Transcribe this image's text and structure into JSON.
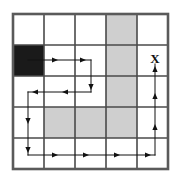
{
  "figure": {
    "title": "",
    "type": "gridworld-path-diagram",
    "grid": {
      "rows": 5,
      "cols": 5,
      "origin_x": 13,
      "origin_y": 14,
      "cell_size": 31,
      "border_color": "#5a5a5a",
      "line_color": "#4a4a4a",
      "background_color": "#ffffff"
    },
    "cells": {
      "blocked_color": "#1a1a1a",
      "shaded_color": "#cfcfcf",
      "empty_color": "#ffffff",
      "blocked": [
        {
          "row": 1,
          "col": 0,
          "label": "start"
        }
      ],
      "shaded": [
        {
          "row": 0,
          "col": 3
        },
        {
          "row": 1,
          "col": 3
        },
        {
          "row": 2,
          "col": 3
        },
        {
          "row": 3,
          "col": 1
        },
        {
          "row": 3,
          "col": 2
        },
        {
          "row": 3,
          "col": 3
        }
      ]
    },
    "markers": [
      {
        "name": "goal-x-marker",
        "glyph": "X",
        "x": 155,
        "y": 60
      }
    ],
    "path": {
      "color": "#111111",
      "stroke_width": 1,
      "segments": [
        {
          "name": "seg-right-row1",
          "x1": 28,
          "y1": 60,
          "x2": 91,
          "y2": 60,
          "direction": "right"
        },
        {
          "name": "seg-down-col2",
          "x1": 91,
          "y1": 60,
          "x2": 91,
          "y2": 92,
          "direction": "down"
        },
        {
          "name": "seg-left-row2",
          "x1": 91,
          "y1": 92,
          "x2": 28,
          "y2": 92,
          "direction": "left"
        },
        {
          "name": "seg-down-col0",
          "x1": 28,
          "y1": 92,
          "x2": 28,
          "y2": 155,
          "direction": "down"
        },
        {
          "name": "seg-right-row4",
          "x1": 28,
          "y1": 155,
          "x2": 155,
          "y2": 155,
          "direction": "right"
        },
        {
          "name": "seg-up-col4",
          "x1": 155,
          "y1": 155,
          "x2": 155,
          "y2": 64,
          "direction": "up"
        }
      ],
      "arrowheads": [
        {
          "name": "arrowhead-right-1",
          "x": 58,
          "y": 60,
          "direction": "right"
        },
        {
          "name": "arrowhead-right-2",
          "x": 86,
          "y": 60,
          "direction": "right"
        },
        {
          "name": "arrowhead-down-1",
          "x": 91,
          "y": 90,
          "direction": "down"
        },
        {
          "name": "arrowhead-left-1",
          "x": 62,
          "y": 92,
          "direction": "left"
        },
        {
          "name": "arrowhead-left-2",
          "x": 32,
          "y": 92,
          "direction": "left"
        },
        {
          "name": "arrowhead-down-2",
          "x": 28,
          "y": 124,
          "direction": "down"
        },
        {
          "name": "arrowhead-down-3",
          "x": 28,
          "y": 153,
          "direction": "down"
        },
        {
          "name": "arrowhead-right-3",
          "x": 58,
          "y": 155,
          "direction": "right"
        },
        {
          "name": "arrowhead-right-4",
          "x": 89,
          "y": 155,
          "direction": "right"
        },
        {
          "name": "arrowhead-right-5",
          "x": 120,
          "y": 155,
          "direction": "right"
        },
        {
          "name": "arrowhead-right-6",
          "x": 151,
          "y": 155,
          "direction": "right"
        },
        {
          "name": "arrowhead-up-1",
          "x": 155,
          "y": 124,
          "direction": "up"
        },
        {
          "name": "arrowhead-up-2",
          "x": 155,
          "y": 93,
          "direction": "up"
        },
        {
          "name": "arrowhead-up-3",
          "x": 155,
          "y": 66,
          "direction": "up"
        }
      ]
    }
  },
  "chart_data": {
    "type": "heatmap",
    "title": "",
    "xlabel": "",
    "ylabel": "",
    "categories": [
      "c0",
      "c1",
      "c2",
      "c3",
      "c4"
    ],
    "rows": [
      "r0",
      "r1",
      "r2",
      "r3",
      "r4"
    ],
    "legend": [],
    "grid": true,
    "values": [
      [
        0,
        0,
        0,
        1,
        0
      ],
      [
        2,
        0,
        0,
        1,
        0
      ],
      [
        0,
        0,
        0,
        1,
        0
      ],
      [
        0,
        1,
        1,
        1,
        0
      ],
      [
        0,
        0,
        0,
        0,
        0
      ]
    ],
    "value_key": {
      "0": "empty",
      "1": "shaded",
      "2": "blocked"
    }
  }
}
